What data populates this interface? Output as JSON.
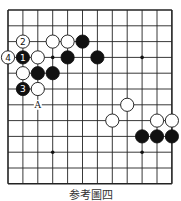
{
  "diagram": {
    "caption": "参考圖四",
    "grid": {
      "cols": 12,
      "rows": 12,
      "x0": 8,
      "y0": 10,
      "dx": 14.9,
      "dy": 15.8,
      "line_color": "#222222",
      "border_width": 1.6,
      "line_width": 0.9
    },
    "hoshi": [
      [
        3,
        3
      ],
      [
        9,
        3
      ],
      [
        3,
        9
      ],
      [
        9,
        9
      ]
    ],
    "stones": [
      {
        "col": 1,
        "row": 2,
        "color": "white",
        "label": "2"
      },
      {
        "col": 3,
        "row": 2,
        "color": "white",
        "label": ""
      },
      {
        "col": 4,
        "row": 2,
        "color": "white",
        "label": ""
      },
      {
        "col": 5,
        "row": 2,
        "color": "black",
        "label": ""
      },
      {
        "col": 0,
        "row": 3,
        "color": "white",
        "label": "4"
      },
      {
        "col": 1,
        "row": 3,
        "color": "black",
        "label": "1"
      },
      {
        "col": 2,
        "row": 3,
        "color": "white",
        "label": ""
      },
      {
        "col": 4,
        "row": 3,
        "color": "black",
        "label": ""
      },
      {
        "col": 6,
        "row": 3,
        "color": "black",
        "label": ""
      },
      {
        "col": 1,
        "row": 4,
        "color": "white",
        "label": ""
      },
      {
        "col": 2,
        "row": 4,
        "color": "black",
        "label": ""
      },
      {
        "col": 3,
        "row": 4,
        "color": "black",
        "label": ""
      },
      {
        "col": 1,
        "row": 5,
        "color": "black",
        "label": "3"
      },
      {
        "col": 2,
        "row": 5,
        "color": "white",
        "label": ""
      },
      {
        "col": 8,
        "row": 6,
        "color": "white",
        "label": ""
      },
      {
        "col": 7,
        "row": 7,
        "color": "white",
        "label": ""
      },
      {
        "col": 10,
        "row": 7,
        "color": "white",
        "label": ""
      },
      {
        "col": 11,
        "row": 7,
        "color": "white",
        "label": ""
      },
      {
        "col": 9,
        "row": 8,
        "color": "black",
        "label": ""
      },
      {
        "col": 10,
        "row": 8,
        "color": "black",
        "label": ""
      },
      {
        "col": 11,
        "row": 8,
        "color": "black",
        "label": ""
      }
    ],
    "marks": [
      {
        "col": 2,
        "row": 6,
        "label": "A"
      }
    ]
  }
}
